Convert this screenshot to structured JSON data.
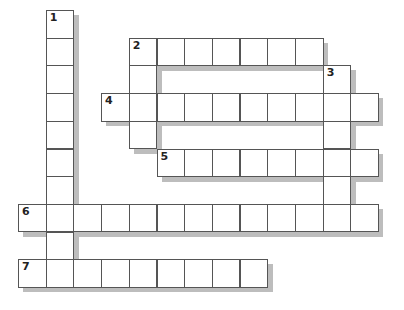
{
  "puzzle": {
    "type": "crossword",
    "cell_size": 27.7,
    "origin": {
      "x": 18,
      "y": 10
    },
    "entries": [
      {
        "number": "1",
        "direction": "down",
        "row": 0,
        "col": 1,
        "length": 10
      },
      {
        "number": "2",
        "direction": "across",
        "row": 1,
        "col": 4,
        "length": 7
      },
      {
        "number": "2",
        "direction": "down",
        "row": 1,
        "col": 4,
        "length": 4
      },
      {
        "number": "3",
        "direction": "down",
        "row": 2,
        "col": 11,
        "length": 6
      },
      {
        "number": "4",
        "direction": "across",
        "row": 3,
        "col": 3,
        "length": 10
      },
      {
        "number": "5",
        "direction": "across",
        "row": 5,
        "col": 5,
        "length": 8
      },
      {
        "number": "6",
        "direction": "across",
        "row": 7,
        "col": 0,
        "length": 13
      },
      {
        "number": "7",
        "direction": "across",
        "row": 9,
        "col": 0,
        "length": 9
      }
    ],
    "colors": {
      "border": "#555555",
      "shadow": "#bdbdbd",
      "cell": "#ffffff"
    }
  }
}
